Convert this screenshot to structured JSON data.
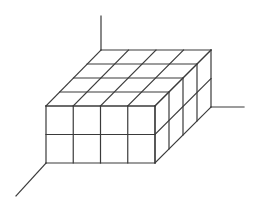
{
  "diagram": {
    "type": "isometric-cube-arrangement",
    "dimensions": {
      "width_cubes": 4,
      "depth_cubes": 4,
      "height_layers": 2
    },
    "total_cubes": 32,
    "stroke_color": "#3a3a3a",
    "background_color": "#ffffff",
    "geometry": {
      "front_top_left": [
        46,
        106
      ],
      "front_top_right": [
        155,
        106
      ],
      "front_bottom_left": [
        46,
        163
      ],
      "front_bottom_right": [
        155,
        163
      ],
      "back_top_left": [
        101,
        50
      ],
      "back_top_right": [
        211,
        50
      ],
      "back_bottom_right": [
        211,
        107
      ]
    },
    "axes": [
      {
        "name": "vertical-axis",
        "from": [
          101,
          16
        ],
        "to": [
          101,
          50
        ]
      },
      {
        "name": "right-axis",
        "from": [
          211,
          107
        ],
        "to": [
          244,
          107
        ]
      },
      {
        "name": "depth-axis",
        "from": [
          46,
          163
        ],
        "to": [
          16,
          196
        ]
      }
    ]
  }
}
